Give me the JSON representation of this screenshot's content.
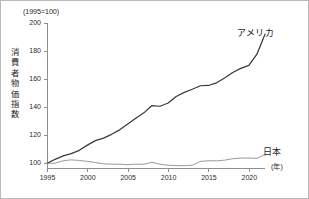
{
  "figure": {
    "unit_caption": "(1995=100)",
    "y_axis_title_chars": [
      "消",
      "費",
      "者",
      "物",
      "価",
      "指",
      "数"
    ],
    "x_axis_unit": "(年)",
    "usa_label": "アメリカ",
    "japan_label": "日本",
    "colors": {
      "usa_line": "#3a3a3a",
      "japan_line": "#9a9a9a",
      "axis": "#8e8e8e",
      "text": "#1d1d1d",
      "border": "#b9b9b9",
      "background": "#ffffff"
    }
  },
  "chart_data": {
    "type": "line",
    "subtitle": "(1995=100)",
    "xlabel": "(年)",
    "ylabel": "消費者物価指数",
    "xlim": [
      1995,
      2022
    ],
    "ylim": [
      96,
      200
    ],
    "grid": false,
    "legend": "inline-right",
    "y_ticks": [
      100,
      120,
      140,
      160,
      180,
      200
    ],
    "x_ticks": [
      1995,
      2000,
      2005,
      2010,
      2015,
      2020
    ],
    "x": [
      1995,
      1996,
      1997,
      1998,
      1999,
      2000,
      2001,
      2002,
      2003,
      2004,
      2005,
      2006,
      2007,
      2008,
      2009,
      2010,
      2011,
      2012,
      2013,
      2014,
      2015,
      2016,
      2017,
      2018,
      2019,
      2020,
      2021,
      2022
    ],
    "series": [
      {
        "name": "アメリカ",
        "color": "#3a3a3a",
        "values": [
          100.0,
          102.9,
          105.3,
          106.9,
          109.3,
          113.0,
          116.2,
          118.0,
          120.7,
          123.9,
          128.1,
          132.2,
          136.0,
          141.2,
          140.7,
          143.0,
          147.6,
          150.6,
          152.8,
          155.3,
          155.5,
          157.4,
          160.8,
          164.7,
          167.7,
          169.8,
          177.8,
          192.0
        ]
      },
      {
        "name": "日本",
        "color": "#9a9a9a",
        "values": [
          100.0,
          100.1,
          101.9,
          102.5,
          102.1,
          101.4,
          100.6,
          99.7,
          99.4,
          99.4,
          99.1,
          99.4,
          99.4,
          100.8,
          99.4,
          98.7,
          98.4,
          98.4,
          98.7,
          101.4,
          101.9,
          101.8,
          102.3,
          103.3,
          103.8,
          103.8,
          103.6,
          106.3
        ]
      }
    ]
  }
}
